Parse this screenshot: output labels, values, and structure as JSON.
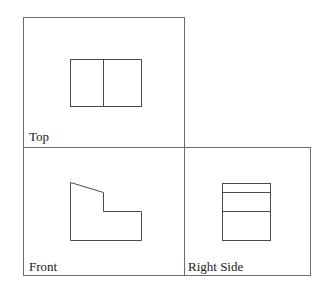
{
  "diagram": {
    "type": "orthographic-projection",
    "views": [
      {
        "id": "top",
        "label": "Top"
      },
      {
        "id": "front",
        "label": "Front"
      },
      {
        "id": "right",
        "label": "Right Side"
      }
    ]
  }
}
